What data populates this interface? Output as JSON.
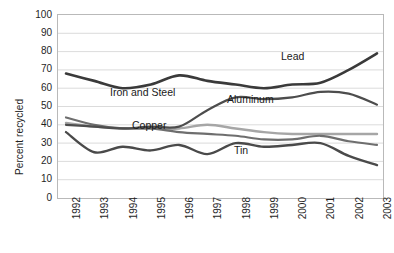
{
  "chart_data": {
    "type": "line",
    "title": "",
    "subtitle": "",
    "xlabel": "",
    "ylabel": "Percent recycled",
    "ylim": [
      0,
      100
    ],
    "ytick_step": 10,
    "yticks": [
      "100",
      "90",
      "80",
      "70",
      "60",
      "50",
      "40",
      "30",
      "20",
      "10",
      "0"
    ],
    "grid": true,
    "grid_orientation": "horizontal",
    "legend": "inline-labels",
    "legend_position": "inside-plot",
    "x": [
      "1992",
      "1993",
      "1994",
      "1995",
      "1996",
      "1997",
      "1998",
      "1999",
      "2000",
      "2001",
      "2002",
      "2003"
    ],
    "categories": [
      "1992",
      "1993",
      "1994",
      "1995",
      "1996",
      "1997",
      "1998",
      "1999",
      "2000",
      "2001",
      "2002",
      "2003"
    ],
    "series": [
      {
        "name": "Lead",
        "label": "Lead",
        "color": "#3a3a3a",
        "width": 2.6,
        "values": [
          68,
          64,
          60,
          62,
          67,
          64,
          62,
          60,
          62,
          63,
          70,
          79
        ]
      },
      {
        "name": "Iron and Steel",
        "label": "Iron and Steel",
        "color": "#4d4d4d",
        "width": 2.2,
        "values": [
          40,
          39,
          38,
          39,
          39,
          48,
          55,
          54,
          55,
          58,
          57,
          51
        ]
      },
      {
        "name": "Aluminum",
        "label": "Aluminum",
        "color": "#a6a6a6",
        "width": 2.4,
        "values": [
          41,
          39,
          38,
          38,
          38,
          40,
          38,
          36,
          35,
          35,
          35,
          35
        ]
      },
      {
        "name": "Copper",
        "label": "Copper",
        "color": "#6e6e6e",
        "width": 2.2,
        "values": [
          44,
          40,
          38,
          38,
          36,
          35,
          34,
          32,
          32,
          34,
          31,
          29
        ]
      },
      {
        "name": "Tin",
        "label": "Tin",
        "color": "#4a4a4a",
        "width": 2.4,
        "values": [
          36,
          25,
          28,
          26,
          29,
          24,
          30,
          28,
          29,
          30,
          23,
          18
        ]
      }
    ],
    "annotations": [
      {
        "text": "Lead",
        "series": "Lead"
      },
      {
        "text": "Iron and Steel",
        "series": "Iron and Steel"
      },
      {
        "text": "Aluminum",
        "series": "Aluminum"
      },
      {
        "text": "Copper",
        "series": "Copper"
      },
      {
        "text": "Tin",
        "series": "Tin"
      }
    ]
  },
  "labels": {
    "lead": "Lead",
    "iron_and_steel": "Iron and Steel",
    "aluminum": "Aluminum",
    "copper": "Copper",
    "tin": "Tin"
  }
}
